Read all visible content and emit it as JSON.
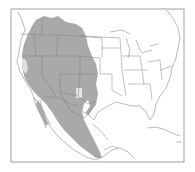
{
  "map": {
    "type": "species-range-map",
    "region": "North America (United States and Mexico)",
    "colors": {
      "background": "#ffffff",
      "frame": "#8a8a8a",
      "borders": "#8c8c8c",
      "range_fill": "#a9a9a9",
      "range_gap": "#dcdcdc"
    },
    "layers": [
      "frame",
      "coastlines",
      "state-borders",
      "range-shading"
    ]
  }
}
